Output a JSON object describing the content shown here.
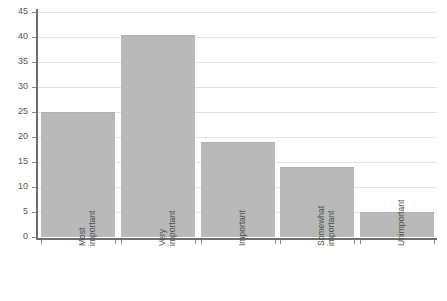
{
  "chart_data": {
    "type": "bar",
    "title": "",
    "subtitle": "",
    "xlabel": "",
    "ylabel": "",
    "categories": [
      "Most important",
      "Very important",
      "Important",
      "Somewhat important",
      "Unimportant"
    ],
    "category_lines": [
      [
        "Most",
        "important"
      ],
      [
        "Very",
        "important"
      ],
      [
        "Important",
        ""
      ],
      [
        "Somewhat",
        "important"
      ],
      [
        "Unimportant",
        ""
      ]
    ],
    "values": [
      25,
      40.5,
      19,
      14,
      5
    ],
    "ylim": [
      0,
      45
    ],
    "ytick_step": 5,
    "yticks": [
      "0",
      "5",
      "10",
      "15",
      "20",
      "25",
      "30",
      "35",
      "40",
      "45"
    ],
    "grid": true,
    "legend": "none",
    "bar_color": "#b9b9b9",
    "gridline_color": "#e3e3e3",
    "axis_color": "#6e6e6e",
    "background_color": "#ffffff"
  }
}
